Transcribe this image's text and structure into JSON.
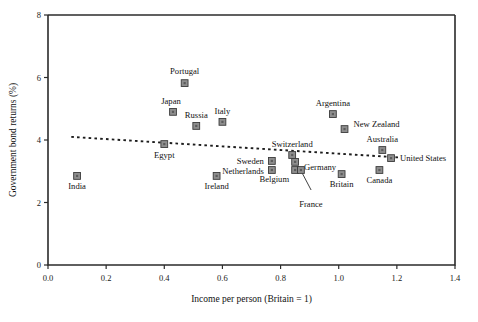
{
  "chart_data": {
    "type": "scatter",
    "title": "",
    "xlabel": "Income per person (Britain = 1)",
    "ylabel": "Government bond returns (%)",
    "xlim": [
      0.0,
      1.4
    ],
    "ylim": [
      0,
      8
    ],
    "xticks": [
      "0.0",
      "0.2",
      "0.4",
      "0.6",
      "0.8",
      "1.0",
      "1.2",
      "1.4"
    ],
    "xtick_values": [
      0.0,
      0.2,
      0.4,
      0.6,
      0.8,
      1.0,
      1.2,
      1.4
    ],
    "yticks": [
      "0",
      "2",
      "4",
      "6",
      "8"
    ],
    "ytick_values": [
      0,
      2,
      4,
      6,
      8
    ],
    "grid": false,
    "legend": "none",
    "marker_color": "#8e8e8e",
    "marker_edge_color": "#3a3a3a",
    "trendline_color": "#1d1d1d",
    "trendline": {
      "style": "dashed",
      "x_start": 0.08,
      "y_start": 4.1,
      "x_end": 1.21,
      "y_end": 3.44
    },
    "points": [
      {
        "name": "India",
        "x": 0.1,
        "y": 2.85,
        "label_dx": 0,
        "label_dy": 13,
        "anchor": "middle"
      },
      {
        "name": "Egypt",
        "x": 0.4,
        "y": 3.87,
        "label_dx": 0,
        "label_dy": 14,
        "anchor": "middle"
      },
      {
        "name": "Japan",
        "x": 0.43,
        "y": 4.9,
        "label_dx": -2,
        "label_dy": -8,
        "anchor": "middle"
      },
      {
        "name": "Portugal",
        "x": 0.47,
        "y": 5.82,
        "label_dx": 0,
        "label_dy": -9,
        "anchor": "middle"
      },
      {
        "name": "Russia",
        "x": 0.51,
        "y": 4.45,
        "label_dx": 0,
        "label_dy": -8,
        "anchor": "middle"
      },
      {
        "name": "Ireland",
        "x": 0.58,
        "y": 2.85,
        "label_dx": 0,
        "label_dy": 13,
        "anchor": "middle"
      },
      {
        "name": "Italy",
        "x": 0.6,
        "y": 4.58,
        "label_dx": 0,
        "label_dy": -8,
        "anchor": "middle"
      },
      {
        "name": "Sweden",
        "x": 0.77,
        "y": 3.33,
        "label_dx": -8,
        "label_dy": 3,
        "anchor": "end"
      },
      {
        "name": "Netherlands",
        "x": 0.77,
        "y": 3.04,
        "label_dx": -8,
        "label_dy": 4,
        "anchor": "end"
      },
      {
        "name": "Switzerland",
        "x": 0.84,
        "y": 3.52,
        "label_dx": 0,
        "label_dy": -8,
        "anchor": "middle"
      },
      {
        "name": "Germany",
        "x": 0.85,
        "y": 3.3,
        "label_dx": 9,
        "label_dy": 8,
        "anchor": "start"
      },
      {
        "name": "Belgium",
        "x": 0.85,
        "y": 3.04,
        "label_dx": -6,
        "label_dy": 12,
        "anchor": "end"
      },
      {
        "name": "France",
        "x": 0.87,
        "y": 3.04,
        "label_dx": 10,
        "label_dy": 37,
        "anchor": "middle"
      },
      {
        "name": "Argentina",
        "x": 0.98,
        "y": 4.83,
        "label_dx": 0,
        "label_dy": -8,
        "anchor": "middle"
      },
      {
        "name": "Britain",
        "x": 1.01,
        "y": 2.91,
        "label_dx": 0,
        "label_dy": 13,
        "anchor": "middle"
      },
      {
        "name": "New Zealand",
        "x": 1.02,
        "y": 4.35,
        "label_dx": 9,
        "label_dy": -2,
        "anchor": "start"
      },
      {
        "name": "Canada",
        "x": 1.14,
        "y": 3.04,
        "label_dx": 0,
        "label_dy": 13,
        "anchor": "middle"
      },
      {
        "name": "Australia",
        "x": 1.15,
        "y": 3.68,
        "label_dx": 0,
        "label_dy": -8,
        "anchor": "middle"
      },
      {
        "name": "United States",
        "x": 1.18,
        "y": 3.42,
        "label_dx": 9,
        "label_dy": 3,
        "anchor": "start"
      }
    ],
    "leader_lines": [
      {
        "from_name": "France",
        "x1": 0.905,
        "y1": 2.4,
        "x2": 0.875,
        "y2": 2.93
      }
    ]
  }
}
